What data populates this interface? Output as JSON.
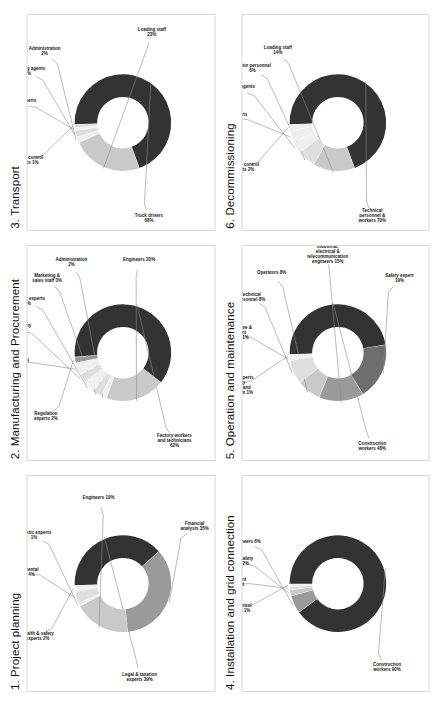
{
  "figure": {
    "background": "#ffffff",
    "panel_border": "#d8d8d8"
  },
  "palette": {
    "dark": "#333333",
    "mid_dark": "#6e6e6e",
    "mid": "#9a9a9a",
    "light": "#c9c9c9",
    "lighter": "#dedede",
    "lightest": "#efefef",
    "leader_line": "#8a8a8a"
  },
  "panels": [
    {
      "id": "project-planning",
      "title": "1. Project planning",
      "chart_data": {
        "type": "pie",
        "title": "1. Project planning",
        "labels": [
          "Legal & taxation experts",
          "Financial analysts",
          "Engineers",
          "Logistic experts",
          "Environmental experts",
          "Health & safety experts"
        ],
        "values": [
          39,
          35,
          19,
          1,
          4,
          2
        ],
        "unit": "%",
        "annotations": [
          "Legal & taxation experts\n39%",
          "Financial analysts\n35%",
          "Engineers\n19%",
          "Logistic experts\n1%",
          "Environmental experts\n4%",
          "Health & safety experts\n2%"
        ]
      }
    },
    {
      "id": "manufacturing-and-procurement",
      "title": "2. Manufacturing and Procurement",
      "chart_data": {
        "type": "pie",
        "title": "2. Manufacturing and Procurement",
        "labels": [
          "Factory workers and technicians",
          "Engineers",
          "Administration",
          "Marketing & sales staff",
          "Logistic experts",
          "Health & safety experts",
          "Quality control experts",
          "Regulation experts"
        ],
        "values": [
          62,
          20,
          2,
          3,
          4,
          3,
          4,
          2
        ],
        "unit": "%",
        "annotations": [
          "Factory workers and technicians\n62%",
          "Engineers\n20%",
          "Administration\n2%",
          "Marketing & sales staff\n3%",
          "Logistic experts\n4%",
          "Health & safety experts\n3%",
          "Quality control experts\n4%",
          "Regulation experts\n2%"
        ]
      }
    },
    {
      "id": "transport",
      "title": "3. Transport",
      "chart_data": {
        "type": "pie",
        "title": "3. Transport",
        "labels": [
          "Truck drivers",
          "Loading staff",
          "Administration",
          "Shipping agents",
          "Logistic experts",
          "Quality control agents"
        ],
        "values": [
          68,
          23,
          2,
          2,
          1,
          1
        ],
        "unit": "%",
        "annotations": [
          "Truck drivers\n68%",
          "Loading staff\n23%",
          "Administration\n2%",
          "Shipping agents\n2%",
          "Logistic experts\n1%",
          "Quality control agents\n1%"
        ]
      }
    },
    {
      "id": "installation-and-grid-connection",
      "title": "4. Installation and grid connection",
      "chart_data": {
        "type": "pie",
        "title": "4. Installation and grid connection",
        "labels": [
          "Construction workers",
          "Engineers",
          "Health & safety experts",
          "Environment experts",
          "Quality control personnel"
        ],
        "values": [
          90,
          6,
          2,
          1,
          1
        ],
        "unit": "%",
        "annotations": [
          "Construction workers\n90%",
          "Engineers\n6%",
          "Health & safety experts\n2%",
          "Environment experts\n1%",
          "Quality control personnel\n1%"
        ]
      }
    },
    {
      "id": "operation-and-maintenance",
      "title": "5. Operation and maintenance",
      "chart_data": {
        "type": "pie",
        "title": "5. Operation and maintenance",
        "labels": [
          "Construction workers",
          "Safety expert",
          "Industrial, electrical & telecommunication engineers",
          "Operators",
          "Technical personnel",
          "Administrative & accountant personnel",
          "Lawyers, experts in energy regulation and management"
        ],
        "values": [
          48,
          19,
          15,
          8,
          8,
          1,
          1
        ],
        "unit": "%",
        "annotations": [
          "Construction workers\n48%",
          "Safety expert\n19%",
          "Industrial, electrical & telecommunication engineers\n15%",
          "Operators\n8%",
          "Technical personnel\n8%",
          "Administrative & accountant personnel\n1%",
          "Lawyers, experts in energy regulation and management\n1%"
        ]
      }
    },
    {
      "id": "decommissioning",
      "title": "6. Decommissioning",
      "chart_data": {
        "type": "pie",
        "title": "6. Decommissioning",
        "labels": [
          "Technical personnel & workers",
          "Loading staff",
          "Admin personnel",
          "Shipping agents",
          "Logistic experts",
          "Quality control agents"
        ],
        "values": [
          70,
          14,
          6,
          4,
          4,
          2
        ],
        "unit": "%",
        "annotations": [
          "Technical personnel & workers\n70%",
          "Loading staff\n14%",
          "Admin personnel\n6%",
          "Shipping agents\n4%",
          "Logistic experts\n4%",
          "Quality control agents\n2%"
        ]
      }
    }
  ]
}
